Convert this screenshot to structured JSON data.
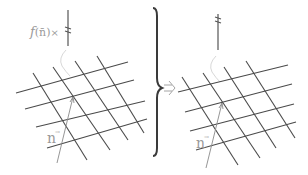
{
  "colors": {
    "background": "#ffffff",
    "grid": "#4a4a4a",
    "normal_vector": "#8a8a8a",
    "label": "#9a9a9a",
    "brace": "#3a3a3a"
  },
  "left_panel": {
    "force_label": "f(n̄)×",
    "force_label_parts": {
      "func": "f",
      "arg": "(n̄)",
      "times": "×"
    },
    "normal_label": "n",
    "normal_label_accent": "→"
  },
  "right_panel": {
    "normal_label": "n",
    "normal_label_accent": "→"
  },
  "implies_symbol": "⇒",
  "brace_symbol": "}"
}
